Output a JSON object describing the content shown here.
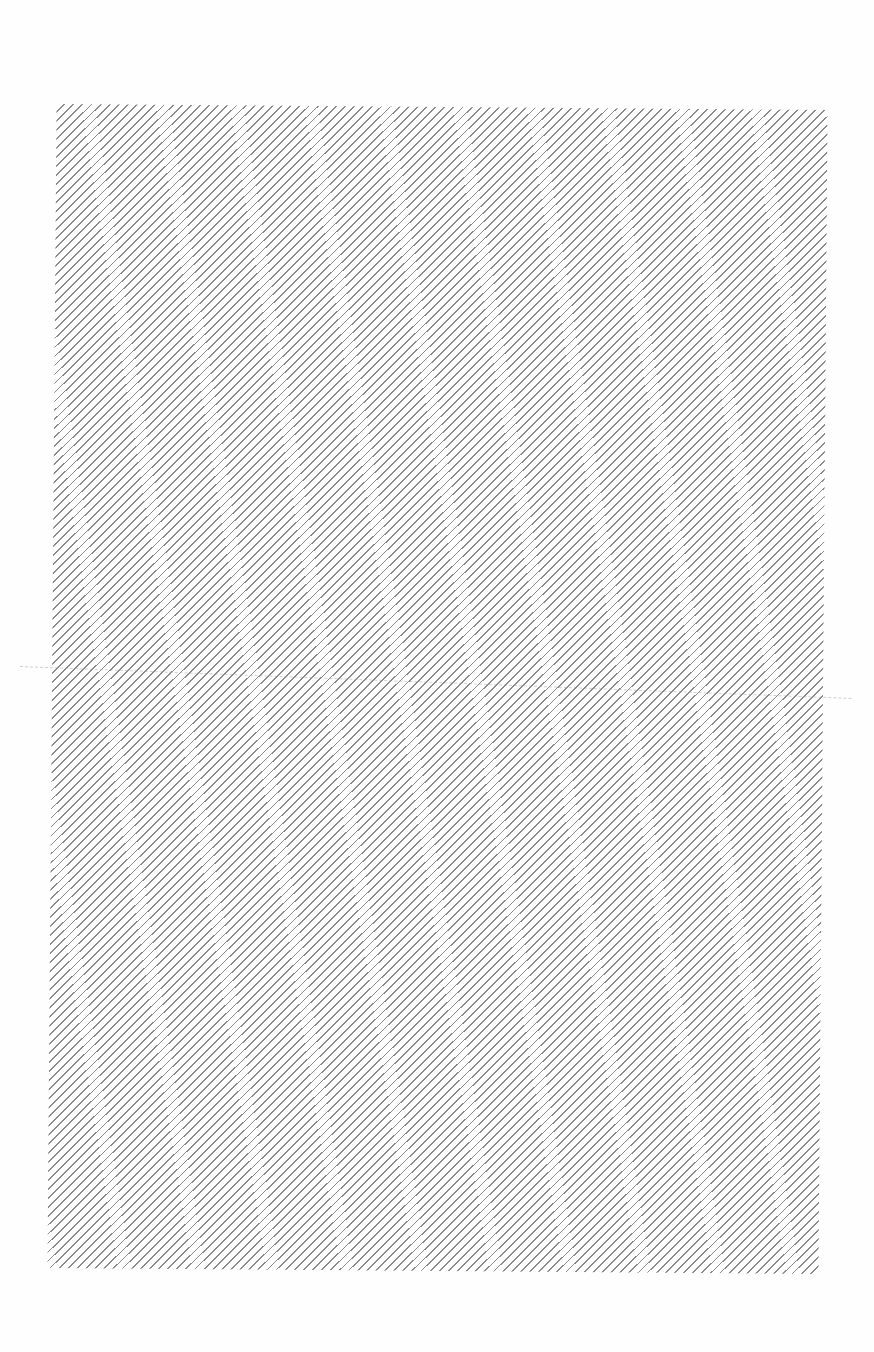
{
  "document": {
    "type": "scanned-page",
    "text": [],
    "panel": {
      "pattern": "diagonal-hatch",
      "line_color": "#8a8a8a",
      "background_color": "#ffffff",
      "angle_deg": 45
    },
    "artifacts": {
      "fold_line": "faint-dashed-horizontal"
    }
  }
}
